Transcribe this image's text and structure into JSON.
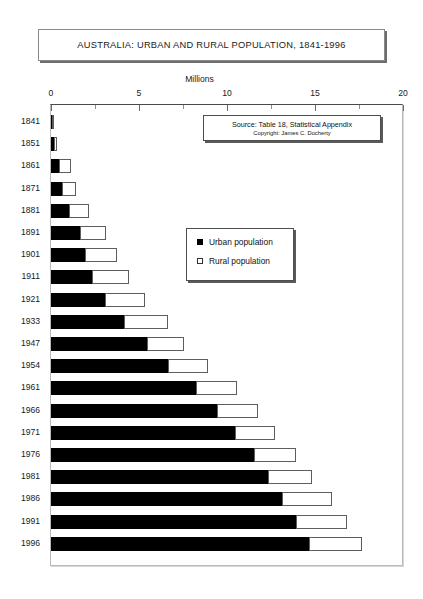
{
  "title": "AUSTRALIA: URBAN AND RURAL POPULATION, 1841-1996",
  "source": {
    "line1": "Source: Table 18, Statistical Appendix",
    "line2": "Copyright: James C. Docherty"
  },
  "legend": {
    "urban_label": "Urban population",
    "rural_label": "Rural population",
    "urban_color": "#000000",
    "rural_color": "#ffffff"
  },
  "chart_data": {
    "type": "bar",
    "orientation": "horizontal",
    "stacked": true,
    "title": "AUSTRALIA: URBAN AND RURAL POPULATION, 1841-1996",
    "xlabel": "Millions",
    "ylabel": "",
    "xlim": [
      0,
      20
    ],
    "xticks": [
      0,
      5,
      10,
      15,
      20
    ],
    "xtick_labels": [
      "0",
      "5",
      "10",
      "15",
      "20"
    ],
    "minor_xticks": [
      2.5,
      7.5,
      12.5,
      17.5
    ],
    "grid": false,
    "legend_position": "center",
    "categories": [
      "1841",
      "1851",
      "1861",
      "1871",
      "1881",
      "1891",
      "1901",
      "1911",
      "1921",
      "1933",
      "1947",
      "1954",
      "1961",
      "1966",
      "1971",
      "1976",
      "1981",
      "1986",
      "1991",
      "1996"
    ],
    "series": [
      {
        "name": "Urban population",
        "color": "#000000",
        "values": [
          0.1,
          0.2,
          0.5,
          0.7,
          1.1,
          1.7,
          2.0,
          2.4,
          3.1,
          4.2,
          5.5,
          6.7,
          8.3,
          9.5,
          10.5,
          11.6,
          12.4,
          13.2,
          14.0,
          14.7
        ]
      },
      {
        "name": "Rural population",
        "color": "#ffffff",
        "values": [
          0.1,
          0.2,
          0.7,
          0.8,
          1.1,
          1.5,
          1.8,
          2.1,
          2.3,
          2.5,
          2.1,
          2.3,
          2.3,
          2.3,
          2.3,
          2.4,
          2.5,
          2.8,
          2.9,
          3.0
        ]
      }
    ],
    "totals": [
      0.2,
      0.4,
      1.2,
      1.5,
      2.2,
      3.2,
      3.8,
      4.5,
      5.4,
      6.7,
      7.6,
      9.0,
      10.6,
      11.8,
      12.8,
      14.0,
      14.9,
      16.0,
      16.9,
      17.7
    ]
  }
}
